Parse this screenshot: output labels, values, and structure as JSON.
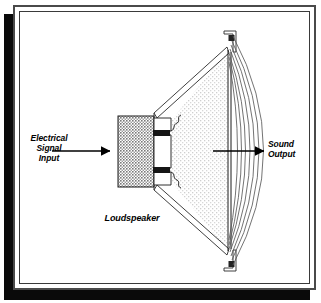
{
  "figure": {
    "type": "technical-line-diagram"
  },
  "labels": {
    "electrical_input": "Electrical\nSignal\nInput",
    "sound_output": "Sound\nOutput",
    "device_name": "Loudspeaker"
  },
  "colors": {
    "ink": "#000000",
    "frame": "#4a4a4a",
    "shadow": "#0a0a0a",
    "magnet_fill": "#b9b9b9",
    "cone_fill": "#e6e6e6",
    "coil_fill": "#1a1a1a",
    "background": "#ffffff"
  },
  "parts": {
    "magnet_block": "magnet assembly",
    "voice_coil_upper": "voice coil winding (upper)",
    "voice_coil_lower": "voice coil winding (lower)",
    "pole_gap": "magnetic gap",
    "spider_upper": "spider suspension (upper)",
    "spider_lower": "spider suspension (lower)",
    "cone": "diaphragm cone",
    "basket_upper": "frame basket (upper)",
    "basket_lower": "frame basket (lower)",
    "mount_top": "top mounting bracket",
    "mount_bottom": "bottom mounting bracket",
    "surround_rim": "cone surround rim"
  },
  "annotations": {
    "input_arrow": "electrical signal direction arrow, pointing right into magnet",
    "output_arrow": "sound propagation direction arrow, pointing right from cone",
    "wave_arc_count": 7
  }
}
